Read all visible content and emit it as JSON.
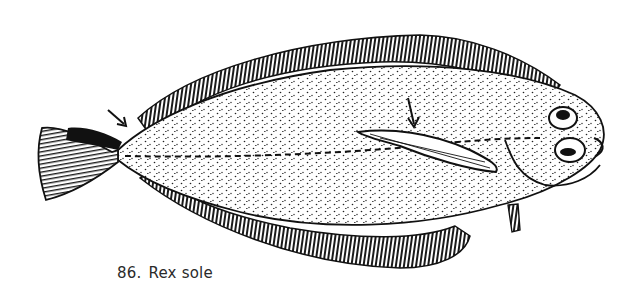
{
  "figure": {
    "caption": {
      "number": "86.",
      "label": "Rex sole"
    },
    "annotations": [
      {
        "name": "arrow-tail-marking",
        "points_to": "dark patch on upper caudal fin"
      },
      {
        "name": "arrow-pectoral-fin",
        "points_to": "long pectoral fin"
      }
    ],
    "colors": {
      "ink": "#111111",
      "paper": "#ffffff"
    }
  }
}
